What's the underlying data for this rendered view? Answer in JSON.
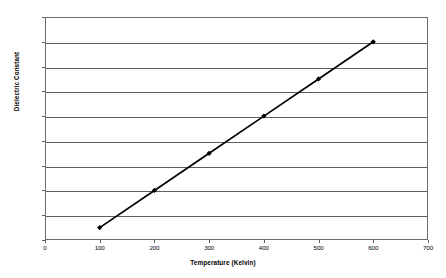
{
  "chart_data": {
    "type": "line",
    "title": "",
    "xlabel": "Temperature (Kelvin)",
    "ylabel": "Dielectric Constant",
    "xlim": [
      0,
      700
    ],
    "ylim": [
      12.5,
      13.4
    ],
    "xticks": [
      0,
      100,
      200,
      300,
      400,
      500,
      600,
      700
    ],
    "xtick_labels": [
      "0",
      "100",
      "200",
      "300",
      "400",
      "500",
      "600",
      "700"
    ],
    "yticks": [
      12.5,
      12.6,
      12.7,
      12.8,
      12.9,
      13.0,
      13.1,
      13.2,
      13.3,
      13.4
    ],
    "ytick_labels": [
      "12.50",
      "12.60",
      "12.70",
      "12.80",
      "12.90",
      "13.00",
      "13.10",
      "13.20",
      "13.30",
      "13.40"
    ],
    "grid": "horizontal",
    "legend": "none",
    "series": [
      {
        "name": "Dielectric Constant",
        "marker": "diamond",
        "color": "#000000",
        "x": [
          100,
          200,
          300,
          400,
          500,
          600
        ],
        "values": [
          12.55,
          12.7,
          12.85,
          13.0,
          13.15,
          13.3
        ]
      }
    ]
  }
}
